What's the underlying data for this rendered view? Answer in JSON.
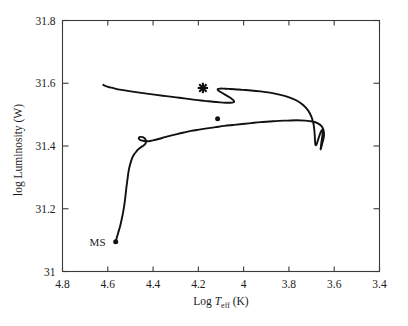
{
  "figure": {
    "background_color": "#ffffff",
    "frame_color": "#3a3a3a",
    "track_color": "#111111"
  },
  "chart_data": {
    "type": "line",
    "title": "",
    "subtitle": "",
    "xlabel": "Log T_eff (K)",
    "xlabel_parts": {
      "prefix": "Log ",
      "symbol": "T",
      "subscript": "eff",
      "unit": " (K)"
    },
    "ylabel": "log Luminosity (W)",
    "xlim": [
      4.8,
      3.4
    ],
    "ylim": [
      31.0,
      31.8
    ],
    "x_inverted": true,
    "grid": false,
    "legend": "none",
    "xticks": [
      4.8,
      4.6,
      4.4,
      4.2,
      4.0,
      3.8,
      3.6,
      3.4
    ],
    "xtick_labels": [
      "4.8",
      "4.6",
      "4.4",
      "4.2",
      "4",
      "3.8",
      "3.6",
      "3.4"
    ],
    "yticks": [
      31.0,
      31.2,
      31.4,
      31.6,
      31.8
    ],
    "ytick_labels": [
      "31",
      "31.2",
      "31.4",
      "31.6",
      "31.8"
    ],
    "annotations": [
      {
        "label": "MS",
        "x": 4.61,
        "y": 31.095,
        "note": "main-sequence start label"
      }
    ],
    "markers": [
      {
        "name": "observed-star",
        "symbol": "asterisk",
        "x": 4.18,
        "y": 31.585
      },
      {
        "name": "ms-start-point",
        "symbol": "dot",
        "x": 4.565,
        "y": 31.095
      },
      {
        "name": "blue-loop-tip-point",
        "symbol": "dot",
        "x": 4.115,
        "y": 31.487
      }
    ],
    "series": [
      {
        "name": "stellar-evolutionary-track",
        "description": "post main-sequence evolutionary track in the HR diagram",
        "x": [
          4.565,
          4.56,
          4.553,
          4.545,
          4.538,
          4.532,
          4.527,
          4.523,
          4.52,
          4.517,
          4.514,
          4.511,
          4.508,
          4.504,
          4.499,
          4.494,
          4.488,
          4.481,
          4.473,
          4.466,
          4.458,
          4.45,
          4.443,
          4.438,
          4.434,
          4.432,
          4.431,
          4.432,
          4.435,
          4.44,
          4.446,
          4.452,
          4.458,
          4.462,
          4.463,
          4.46,
          4.452,
          4.441,
          4.428,
          4.412,
          4.393,
          4.372,
          4.348,
          4.322,
          4.294,
          4.264,
          4.232,
          4.198,
          4.162,
          4.124,
          4.086,
          4.046,
          4.006,
          3.966,
          3.926,
          3.886,
          3.846,
          3.806,
          3.766,
          3.728,
          3.696,
          3.672,
          3.656,
          3.648,
          3.645,
          3.646,
          3.65,
          3.654,
          3.657,
          3.659,
          3.66,
          3.66,
          3.659,
          3.658,
          3.656,
          3.654,
          3.652,
          3.651,
          3.651,
          3.652,
          3.654,
          3.657,
          3.661,
          3.665,
          3.669,
          3.673,
          3.676,
          3.679,
          3.681,
          3.683,
          3.684,
          3.685,
          3.686,
          3.688,
          3.692,
          3.7,
          3.714,
          3.736,
          3.766,
          3.802,
          3.842,
          3.884,
          3.926,
          3.968,
          4.006,
          4.04,
          4.068,
          4.09,
          4.105,
          4.113,
          4.115,
          4.112,
          4.104,
          4.092,
          4.078,
          4.064,
          4.052,
          4.044,
          4.042,
          4.046,
          4.058,
          4.078,
          4.104,
          4.136,
          4.172,
          4.212,
          4.254,
          4.298,
          4.342,
          4.386,
          4.428,
          4.468,
          4.506,
          4.54,
          4.568,
          4.59,
          4.606,
          4.616,
          4.62
        ],
        "y": [
          31.095,
          31.108,
          31.126,
          31.146,
          31.168,
          31.19,
          31.212,
          31.234,
          31.254,
          31.272,
          31.289,
          31.305,
          31.32,
          31.334,
          31.347,
          31.358,
          31.368,
          31.376,
          31.383,
          31.389,
          31.394,
          31.398,
          31.401,
          31.404,
          31.407,
          31.411,
          31.415,
          31.419,
          31.423,
          31.426,
          31.428,
          31.429,
          31.429,
          31.427,
          31.424,
          31.421,
          31.418,
          31.416,
          31.415,
          31.416,
          31.419,
          31.423,
          31.428,
          31.433,
          31.438,
          31.443,
          31.448,
          31.452,
          31.456,
          31.46,
          31.464,
          31.467,
          31.47,
          31.473,
          31.476,
          31.478,
          31.48,
          31.481,
          31.482,
          31.481,
          31.478,
          31.472,
          31.463,
          31.452,
          31.44,
          31.428,
          31.416,
          31.405,
          31.396,
          31.391,
          31.389,
          31.391,
          31.396,
          31.404,
          31.414,
          31.424,
          31.434,
          31.442,
          31.448,
          31.451,
          31.451,
          31.448,
          31.442,
          31.434,
          31.425,
          31.416,
          31.409,
          31.404,
          31.402,
          31.404,
          31.41,
          31.42,
          31.434,
          31.452,
          31.472,
          31.492,
          31.512,
          31.53,
          31.545,
          31.556,
          31.564,
          31.57,
          31.574,
          31.577,
          31.579,
          31.581,
          31.582,
          31.583,
          31.583,
          31.582,
          31.58,
          31.577,
          31.573,
          31.568,
          31.562,
          31.556,
          31.55,
          31.545,
          31.541,
          31.539,
          31.538,
          31.538,
          31.539,
          31.541,
          31.544,
          31.547,
          31.551,
          31.555,
          31.559,
          31.563,
          31.567,
          31.571,
          31.575,
          31.579,
          31.583,
          31.587,
          31.59,
          31.593,
          31.595
        ]
      }
    ]
  }
}
